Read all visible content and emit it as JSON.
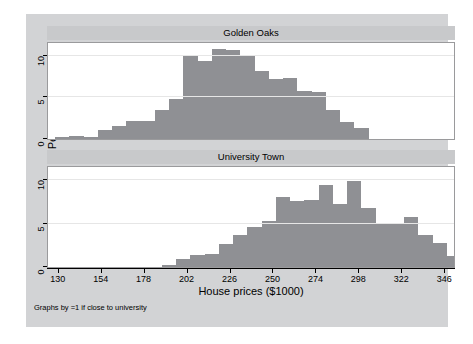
{
  "figure": {
    "background_color": "#d2d3d5",
    "plot_background_color": "#ffffff",
    "bar_color": "#8f9094",
    "gridline_color": "#e6e6e6",
    "title_bar_color": "#c8c9cb"
  },
  "axis": {
    "y_title": "Percent",
    "x_title": "House prices ($1000)",
    "y_ticks": [
      "0",
      "5",
      "10"
    ],
    "x_ticks": [
      "130",
      "154",
      "178",
      "202",
      "226",
      "250",
      "274",
      "298",
      "322",
      "346"
    ]
  },
  "footnote": "Graphs by =1 if close to university",
  "panels": [
    {
      "title": "Golden Oaks"
    },
    {
      "title": "University Town"
    }
  ],
  "chart_data": {
    "type": "bar",
    "title": "",
    "subtitle": "",
    "xlabel": "House prices ($1000)",
    "ylabel": "Percent",
    "xlim": [
      124,
      352
    ],
    "ylim": [
      0,
      11.5
    ],
    "xtick_values": [
      130,
      154,
      178,
      202,
      226,
      250,
      274,
      298,
      322,
      346
    ],
    "ytick_values": [
      0,
      5,
      10
    ],
    "grid": "horizontal-only",
    "legend": "none",
    "panel_layout": "two stacked panels, shared x axis (Stata by-graph)",
    "bin_width": 8,
    "note": "Two histograms of house prices (in $1000s); y axis is Percent of observations within each panel.",
    "panels": [
      {
        "name": "Golden Oaks",
        "bin_starts": [
          128,
          136,
          144,
          152,
          160,
          168,
          176,
          184,
          192,
          200,
          208,
          216,
          224,
          232,
          240,
          248,
          256,
          264,
          272,
          280
        ],
        "bin_centers": [
          132,
          140,
          148,
          156,
          164,
          172,
          180,
          188,
          196,
          204,
          212,
          220,
          228,
          236,
          244,
          252,
          260,
          268,
          276,
          284
        ],
        "values": [
          0.2,
          0.4,
          0.3,
          1.1,
          1.6,
          2.1,
          2.2,
          3.5,
          4.8,
          10.1,
          9.4,
          10.8,
          10.7,
          10.0,
          8.1,
          7.2,
          7.3,
          5.7,
          5.6,
          3.5
        ],
        "tail_bins": [
          {
            "center": 292,
            "value": 2.0
          },
          {
            "center": 300,
            "value": 1.3
          }
        ]
      },
      {
        "name": "University Town",
        "bin_starts": [
          188,
          196,
          204,
          212,
          220,
          228,
          236,
          244,
          252,
          260,
          268,
          276,
          284,
          292,
          300,
          308,
          316,
          324,
          332,
          340
        ],
        "bin_centers": [
          192,
          200,
          208,
          216,
          224,
          232,
          240,
          248,
          256,
          264,
          272,
          280,
          288,
          296,
          304,
          312,
          320,
          328,
          336,
          344
        ],
        "values": [
          0.2,
          0.9,
          1.4,
          1.5,
          2.6,
          3.7,
          4.6,
          5.3,
          8.0,
          7.6,
          7.7,
          9.4,
          7.3,
          9.9,
          6.8,
          5.0,
          5.1,
          5.8,
          3.7,
          2.8
        ],
        "tail_bins": [
          {
            "center": 348,
            "value": 1.3
          }
        ]
      }
    ]
  }
}
